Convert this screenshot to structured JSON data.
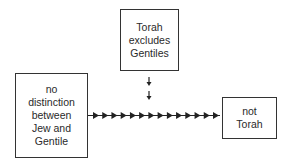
{
  "diagram": {
    "nodes": {
      "top": {
        "label": "Torah\nexcludes\nGentiles"
      },
      "left": {
        "label": "no\ndistinction\nbetween\nJew and\nGentile"
      },
      "right": {
        "label": "not\nTorah"
      }
    },
    "edges": [
      {
        "from": "left",
        "to": "right",
        "style": "chain-of-arrowheads",
        "arrowhead_count": 14
      },
      {
        "from": "top",
        "to": "left-right-edge",
        "style": "double-small-down-arrows"
      }
    ],
    "colors": {
      "stroke": "#333333",
      "background": "#ffffff",
      "text": "#2a2a2a"
    }
  }
}
